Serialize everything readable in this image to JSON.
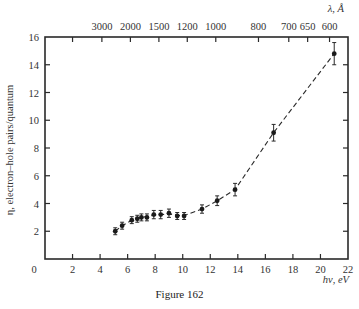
{
  "chart_data": {
    "type": "scatter",
    "title": "",
    "caption": "Figure 162",
    "xlabel": "hν, eV",
    "ylabel": "η, electron–hole pairs/quantum",
    "x2label": "λ, Å",
    "xlim": [
      0,
      22
    ],
    "ylim": [
      0,
      16
    ],
    "x_ticks": [
      0,
      2,
      4,
      6,
      8,
      10,
      12,
      14,
      16,
      18,
      20,
      22
    ],
    "y_ticks": [
      2,
      4,
      6,
      8,
      10,
      12,
      14,
      16
    ],
    "x2_ticks": [
      {
        "label": "",
        "ev": 2.0
      },
      {
        "label": "3000",
        "ev": 4.13
      },
      {
        "label": "2000",
        "ev": 6.2
      },
      {
        "label": "1500",
        "ev": 8.27
      },
      {
        "label": "1200",
        "ev": 10.33
      },
      {
        "label": "1000",
        "ev": 12.4
      },
      {
        "label": "800",
        "ev": 15.5
      },
      {
        "label": "700",
        "ev": 17.7
      },
      {
        "label": "650",
        "ev": 19.07
      },
      {
        "label": "600",
        "ev": 20.66
      }
    ],
    "grid": false,
    "legend": null,
    "series": [
      {
        "name": "η vs hν",
        "style": "markers with error bars, dashed fit line",
        "x": [
          5.1,
          5.6,
          6.3,
          6.7,
          7.0,
          7.4,
          7.9,
          8.4,
          9.0,
          9.6,
          10.1,
          11.4,
          12.5,
          13.8,
          16.6,
          21.0
        ],
        "y": [
          2.0,
          2.4,
          2.8,
          2.9,
          3.0,
          3.0,
          3.2,
          3.2,
          3.3,
          3.1,
          3.1,
          3.6,
          4.2,
          5.0,
          9.1,
          14.8
        ],
        "yerr": [
          0.25,
          0.25,
          0.25,
          0.25,
          0.25,
          0.25,
          0.3,
          0.3,
          0.3,
          0.25,
          0.25,
          0.3,
          0.35,
          0.45,
          0.6,
          0.8
        ]
      }
    ],
    "fit_line": {
      "style": "dashed",
      "x": [
        5.1,
        5.6,
        6.3,
        7.0,
        7.9,
        9.0,
        10.0,
        11.4,
        12.5,
        13.8,
        16.6,
        21.0
      ],
      "y": [
        2.0,
        2.4,
        2.8,
        3.0,
        3.15,
        3.25,
        3.1,
        3.6,
        4.2,
        5.0,
        9.1,
        14.8
      ]
    }
  }
}
